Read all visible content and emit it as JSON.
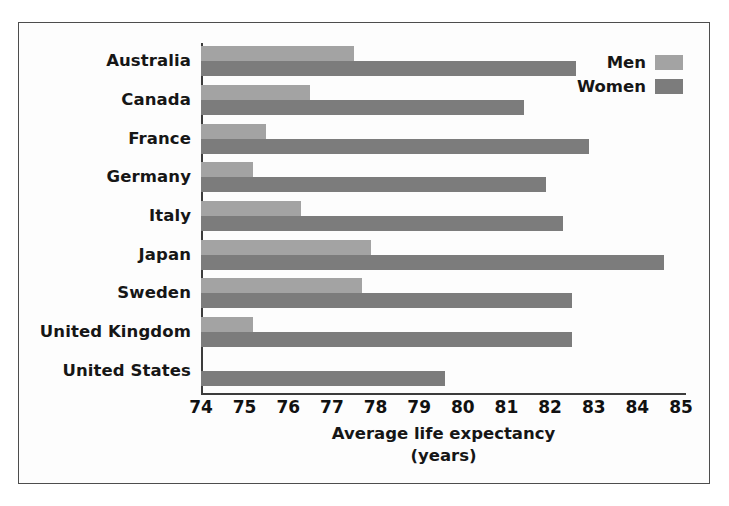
{
  "chart_data": {
    "type": "bar",
    "orientation": "horizontal",
    "title": "",
    "xlabel": "Average life expectancy",
    "xlabel_line2": "(years)",
    "ylabel": "",
    "xlim": [
      74,
      85
    ],
    "xticks": [
      74,
      75,
      76,
      77,
      78,
      79,
      80,
      81,
      82,
      83,
      84,
      85
    ],
    "grid": false,
    "legend_position": "top-right",
    "categories": [
      "Australia",
      "Canada",
      "France",
      "Germany",
      "Italy",
      "Japan",
      "Sweden",
      "United Kingdom",
      "United States"
    ],
    "series": [
      {
        "name": "Men",
        "color": "#a3a3a3",
        "values": [
          77.5,
          76.5,
          75.5,
          75.2,
          76.3,
          77.9,
          77.7,
          75.2,
          null
        ]
      },
      {
        "name": "Women",
        "color": "#7c7c7c",
        "values": [
          82.6,
          81.4,
          82.9,
          81.9,
          82.3,
          84.6,
          82.5,
          82.5,
          79.6
        ]
      }
    ]
  },
  "legend": {
    "items": [
      {
        "label": "Men",
        "color": "#a3a3a3"
      },
      {
        "label": "Women",
        "color": "#7c7c7c"
      }
    ]
  },
  "colors": {
    "men": "#a3a3a3",
    "women": "#7c7c7c",
    "axis": "#3c3c3c",
    "frame": "#4d4d4d",
    "background": "#fdfdfd"
  }
}
